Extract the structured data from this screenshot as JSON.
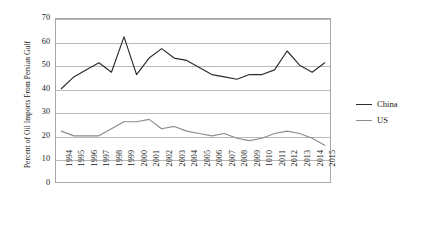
{
  "chart_data": {
    "type": "line",
    "title": "",
    "xlabel": "",
    "ylabel": "Percent of Oil Imports From Persian Gulf",
    "ylim": [
      0,
      70
    ],
    "yticks": [
      0,
      10,
      20,
      30,
      40,
      50,
      60,
      70
    ],
    "grid": true,
    "legend_position": "right",
    "categories": [
      "1994",
      "1995",
      "1996",
      "1997",
      "1998",
      "1999",
      "2000",
      "2001",
      "2002",
      "2003",
      "2004",
      "2005",
      "2006",
      "2007",
      "2008",
      "2009",
      "1010",
      "2011",
      "2012",
      "2013",
      "2014",
      "2015"
    ],
    "series": [
      {
        "name": "China",
        "color": "#2b2b2b",
        "values": [
          40,
          45,
          48,
          51,
          47,
          62,
          46,
          53,
          57,
          53,
          52,
          49,
          46,
          45,
          44,
          46,
          46,
          48,
          56,
          50,
          47,
          51
        ]
      },
      {
        "name": "US",
        "color": "#8c8c8c",
        "values": [
          22,
          20,
          20,
          20,
          23,
          26,
          26,
          27,
          23,
          24,
          22,
          21,
          20,
          21,
          19,
          18,
          19,
          21,
          22,
          21,
          19,
          16
        ]
      }
    ]
  },
  "legend": {
    "items": [
      {
        "label": "China",
        "color": "#2b2b2b"
      },
      {
        "label": "US",
        "color": "#8c8c8c"
      }
    ]
  },
  "axis": {
    "y_title": "Percent of Oil Imports From Persian Gulf"
  }
}
